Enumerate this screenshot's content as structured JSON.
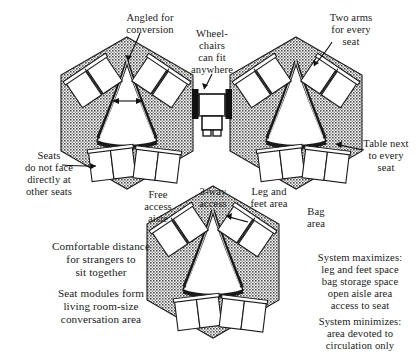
{
  "figure": {
    "kind": "seating-module-plan-diagram",
    "module_count": 3,
    "seats_per_module": 6,
    "seat_pairs_per_module": 3,
    "module_shape": "hexagon",
    "center_shape": "triangle",
    "colors": {
      "ink": "#111111",
      "hatch_fill": "#6f6f6f",
      "background": "#ffffff",
      "seat_fill": "#ffffff",
      "wheelchair_bar": "#111111"
    }
  },
  "annotations": {
    "angled_for_conversion": "Angled for\nconversion",
    "wheelchairs_can_fit_anywhere": "Wheel-\nchairs\ncan fit\nanywhere",
    "two_arms_for_every_seat": "Two arms\nfor every\nseat",
    "seats_do_not_face": "Seats\ndo not face\ndirectly at\nother seats",
    "three_way_access": "3-way\naccess",
    "table_next_to_every_seat": "Table next\nto every\nseat",
    "free_access_aisle": "Free\naccess\naisle",
    "leg_and_feet_area": "Leg and\nfeet area",
    "bag_area": "Bag\narea",
    "comfortable_distance": "Comfortable distance\nfor strangers to\nsit together",
    "seat_modules_form": "Seat modules form\nliving room-size\nconversation area",
    "system_maximizes": "System maximizes:\nleg and feet space\nbag storage space\nopen aisle area\naccess to seat",
    "system_minimizes": "System minimizes:\narea devoted to\ncirculation only"
  },
  "icons": {
    "wheelchair": "wheelchair-plan-icon",
    "module_left": "hexagon-seat-module",
    "module_right": "hexagon-seat-module",
    "module_bottom": "hexagon-seat-module"
  }
}
